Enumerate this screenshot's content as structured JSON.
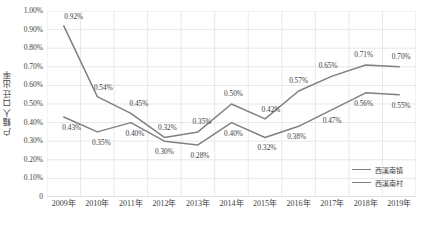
{
  "chart_data": {
    "type": "line",
    "title": "",
    "xlabel": "",
    "ylabel": "户籍人口迁出率",
    "categories": [
      "2009年",
      "2010年",
      "2011年",
      "2012年",
      "2013年",
      "2014年",
      "2015年",
      "2016年",
      "2017年",
      "2018年",
      "2019年"
    ],
    "ylim": [
      0,
      0.01
    ],
    "ytick_labels": [
      "1.00%",
      "0.90%",
      "0.80%",
      "0.70%",
      "0.60%",
      "0.50%",
      "0.40%",
      "0.30%",
      "0.20%",
      "0.10%",
      "0"
    ],
    "ytick_values": [
      1.0,
      0.9,
      0.8,
      0.7,
      0.6,
      0.5,
      0.4,
      0.3,
      0.2,
      0.1,
      0
    ],
    "grid": true,
    "grid_x": true,
    "grid_y": true,
    "legend_position": "bottom-right",
    "series": [
      {
        "name": "西溪南镇",
        "color": "#808080",
        "values": [
          0.92,
          0.54,
          0.45,
          0.32,
          0.35,
          0.5,
          0.42,
          0.57,
          0.65,
          0.71,
          0.7
        ],
        "labels": [
          "0.92%",
          "0.54%",
          "0.45%",
          "0.32%",
          "0.35%",
          "0.50%",
          "0.42%",
          "0.57%",
          "0.65%",
          "0.71%",
          "0.70%"
        ],
        "label_offsets": [
          [
            10,
            -9
          ],
          [
            6,
            -9
          ],
          [
            8,
            -9
          ],
          [
            3,
            -9
          ],
          [
            4,
            -10
          ],
          [
            2,
            -10
          ],
          [
            6,
            -9
          ],
          [
            0,
            -10
          ],
          [
            -4,
            -10
          ],
          [
            -2,
            -10
          ],
          [
            2,
            -10
          ]
        ]
      },
      {
        "name": "西溪南村",
        "color": "#808080",
        "values": [
          0.43,
          0.35,
          0.4,
          0.3,
          0.28,
          0.4,
          0.32,
          0.38,
          0.47,
          0.56,
          0.55
        ],
        "labels": [
          "0.43%",
          "0.35%",
          "0.40%",
          "0.30%",
          "0.28%",
          "0.40%",
          "0.32%",
          "0.38%",
          "0.47%",
          "0.56%",
          "0.55%"
        ],
        "label_offsets": [
          [
            8,
            11
          ],
          [
            4,
            11
          ],
          [
            4,
            11
          ],
          [
            0,
            11
          ],
          [
            2,
            11
          ],
          [
            2,
            11
          ],
          [
            2,
            11
          ],
          [
            -2,
            11
          ],
          [
            0,
            11
          ],
          [
            -2,
            11
          ],
          [
            2,
            11
          ]
        ]
      }
    ]
  },
  "legend": {
    "items": [
      {
        "label": "西溪南镇"
      },
      {
        "label": "西溪南村"
      }
    ]
  }
}
